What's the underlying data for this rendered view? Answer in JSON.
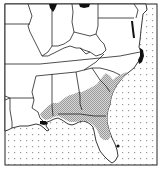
{
  "map": {
    "type": "species range map",
    "region": "Southeastern United States",
    "colors": {
      "land": "#ffffff",
      "ocean_dots": "#9a9a9a",
      "range_shading": "#b8b8b8",
      "border": "#222222",
      "occurrence_marks": "#111111"
    },
    "legend": {
      "ocean": "dotted pattern",
      "range": "stippled gray shading (coastal plain GA, FL, AL, MS, SC, NC)",
      "isolated_records": "solid black spots"
    },
    "isolated_records": [
      {
        "location": "northern Indiana/Illinois border (top)"
      },
      {
        "location": "northern Ohio (top)"
      },
      {
        "location": "Chesapeake Bay, Maryland"
      },
      {
        "location": "coastal North Carolina (Outer Banks)"
      },
      {
        "location": "Mississippi/Louisiana Gulf coast"
      },
      {
        "location": "south-central Florida (dot)"
      }
    ]
  }
}
